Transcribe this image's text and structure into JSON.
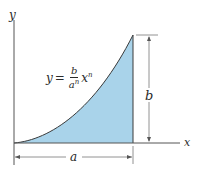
{
  "diagram": {
    "axes": {
      "x_label": "x",
      "y_label": "y"
    },
    "curve": {
      "equation": {
        "lhs": "y",
        "equals": "=",
        "numerator": "b",
        "denominator_base": "a",
        "denominator_exp": "n",
        "var_base": "x",
        "var_exp": "n"
      }
    },
    "dimensions": {
      "width_label": "a",
      "height_label": "b"
    },
    "colors": {
      "fill": "#a9d3ea",
      "line": "#3a3a3a",
      "axis": "#555555"
    }
  }
}
